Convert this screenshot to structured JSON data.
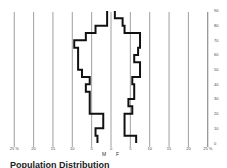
{
  "chart_data": {
    "type": "bar",
    "subtype": "population-pyramid",
    "title": "Population Distribution",
    "xlabel": "%",
    "ylabel": "Age",
    "x_tick_labels_left": [
      "25 %",
      "20",
      "15",
      "10",
      "5",
      "0"
    ],
    "x_tick_labels_right": [
      "5",
      "10",
      "15",
      "20",
      "25 %"
    ],
    "y_tick_labels": [
      "0",
      "10",
      "20",
      "30",
      "40",
      "50",
      "60",
      "70",
      "80",
      "90"
    ],
    "xlim": [
      -25,
      25
    ],
    "ylim": [
      0,
      90
    ],
    "grid": true,
    "categories": [
      "0-5",
      "5-10",
      "10-15",
      "15-20",
      "20-25",
      "25-30",
      "30-35",
      "35-40",
      "40-45",
      "45-50",
      "50-55",
      "55-60",
      "60-65",
      "65-70",
      "70-75",
      "75-80",
      "80-85",
      "85-90"
    ],
    "series": [
      {
        "name": "M",
        "values": [
          3.5,
          4,
          2,
          2,
          5.5,
          5.5,
          5.5,
          6.5,
          5.5,
          7.5,
          8.5,
          8.5,
          8.5,
          9.5,
          6.5,
          4,
          1,
          1
        ]
      },
      {
        "name": "F",
        "values": [
          6.5,
          3.5,
          3.5,
          3.5,
          5.5,
          4.5,
          6,
          6,
          5.5,
          7.5,
          7.5,
          6,
          7,
          7.5,
          7.5,
          3.5,
          3,
          1
        ]
      }
    ],
    "legend": [
      "M",
      "F"
    ]
  },
  "labels": {
    "male": "M",
    "female": "F",
    "title": "Population Distribution"
  }
}
